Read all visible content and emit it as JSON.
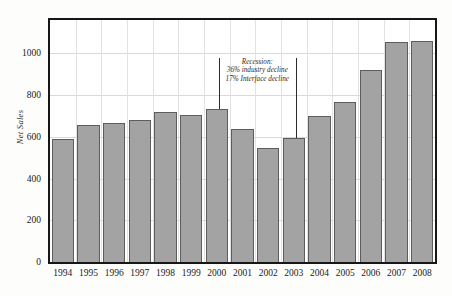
{
  "chart_data": {
    "type": "bar",
    "title": "",
    "xlabel": "",
    "ylabel": "Net Sales",
    "ylim": [
      0,
      1160
    ],
    "yticks": [
      0,
      200,
      400,
      600,
      800,
      1000
    ],
    "ytick_labels": [
      "0",
      "200",
      "400",
      "600",
      "800",
      "1000"
    ],
    "grid": true,
    "legend": null,
    "categories": [
      "1994",
      "1995",
      "1996",
      "1997",
      "1998",
      "1999",
      "2000",
      "2001",
      "2002",
      "2003",
      "2004",
      "2005",
      "2006",
      "2007",
      "2008"
    ],
    "values": [
      590,
      655,
      667,
      681,
      718,
      703,
      733,
      636,
      548,
      593,
      700,
      768,
      920,
      1055,
      1060
    ],
    "series": [
      {
        "name": "Net Sales",
        "values": [
          590,
          655,
          667,
          681,
          718,
          703,
          733,
          636,
          548,
          593,
          700,
          768,
          920,
          1055,
          1060
        ]
      }
    ],
    "bar_color": "#a3a3a3",
    "bar_edge_color": "#5d5d5d",
    "annotations": [
      {
        "name": "recession-note",
        "lines": [
          "Recession:",
          "36% industry decline",
          "17% Interface decline"
        ],
        "start_category": "2000",
        "end_category": "2003"
      }
    ]
  },
  "axes": {
    "y_label": "Net Sales",
    "y_tick_labels": [
      "1000",
      "800",
      "600",
      "400",
      "200",
      "0"
    ],
    "x_tick_labels": [
      "1994",
      "1995",
      "1996",
      "1997",
      "1998",
      "1999",
      "2000",
      "2001",
      "2002",
      "2003",
      "2004",
      "2005",
      "2006",
      "2007",
      "2008"
    ]
  },
  "annotation": {
    "line1": "Recession:",
    "line2": "36% industry decline",
    "line3": "17% Interface decline"
  },
  "colors": {
    "bar_fill": "#a3a3a3",
    "bar_edge": "#5d5d5d",
    "frame": "#171717",
    "grid": "#d9d9d9",
    "background": "#ffffff"
  }
}
